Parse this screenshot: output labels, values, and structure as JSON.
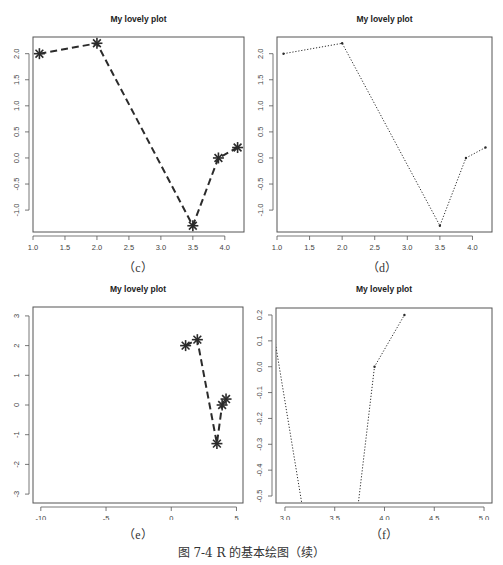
{
  "figure": {
    "caption": "图 7-4   R 的基本绘图（续）"
  },
  "chart_data": [
    {
      "id": "c",
      "panel_label": "（c）",
      "type": "line",
      "title": "My lovely plot",
      "x": [
        1.1,
        2.0,
        3.5,
        3.9,
        4.2
      ],
      "y": [
        2.0,
        2.2,
        -1.3,
        0.0,
        0.2
      ],
      "line_style": "dashed",
      "line_width": 2,
      "marker": "asterisk",
      "marker_size": "large",
      "xlim": [
        1.0,
        4.3
      ],
      "ylim": [
        -1.42,
        2.32
      ],
      "xticks": [
        1.0,
        1.5,
        2.0,
        2.5,
        3.0,
        3.5,
        4.0
      ],
      "xtick_labels": [
        "1.0",
        "1.5",
        "2.0",
        "2.5",
        "3.0",
        "3.5",
        "4.0"
      ],
      "yticks": [
        -1.0,
        -0.5,
        0.0,
        0.5,
        1.0,
        1.5,
        2.0
      ],
      "ytick_labels": [
        "-1.0",
        "-0.5",
        "0.0",
        "0.5",
        "1.0",
        "1.5",
        "2.0"
      ],
      "xlabel": "",
      "ylabel": "",
      "grid": false,
      "legend": null
    },
    {
      "id": "d",
      "panel_label": "（d）",
      "type": "line",
      "title": "My lovely plot",
      "x": [
        1.1,
        2.0,
        3.5,
        3.9,
        4.2
      ],
      "y": [
        2.0,
        2.2,
        -1.3,
        0.0,
        0.2
      ],
      "line_style": "dotted",
      "line_width": 1,
      "marker": "point",
      "marker_size": "small",
      "xlim": [
        1.0,
        4.3
      ],
      "ylim": [
        -1.42,
        2.32
      ],
      "xticks": [
        1.0,
        1.5,
        2.0,
        2.5,
        3.0,
        3.5,
        4.0
      ],
      "xtick_labels": [
        "1.0",
        "1.5",
        "2.0",
        "2.5",
        "3.0",
        "3.5",
        "4.0"
      ],
      "yticks": [
        -1.0,
        -0.5,
        0.0,
        0.5,
        1.0,
        1.5,
        2.0
      ],
      "ytick_labels": [
        "-1.0",
        "-0.5",
        "0.0",
        "0.5",
        "1.0",
        "1.5",
        "2.0"
      ],
      "xlabel": "",
      "ylabel": "",
      "grid": false,
      "legend": null
    },
    {
      "id": "e",
      "panel_label": "（e）",
      "type": "line",
      "title": "My lovely plot",
      "x": [
        1.1,
        2.0,
        3.5,
        3.9,
        4.2
      ],
      "y": [
        2.0,
        2.2,
        -1.3,
        0.0,
        0.2
      ],
      "line_style": "dashed",
      "line_width": 2,
      "marker": "asterisk",
      "marker_size": "large",
      "xlim": [
        -10.6,
        5.5
      ],
      "ylim": [
        -3.3,
        3.3
      ],
      "xticks": [
        -10,
        -5,
        0,
        5
      ],
      "xtick_labels": [
        "-10",
        "-5",
        "0",
        "5"
      ],
      "yticks": [
        -3,
        -2,
        -1,
        0,
        1,
        2,
        3
      ],
      "ytick_labels": [
        "-3",
        "-2",
        "-1",
        "0",
        "1",
        "2",
        "3"
      ],
      "xlabel": "",
      "ylabel": "",
      "grid": false,
      "legend": null
    },
    {
      "id": "f",
      "panel_label": "（f）",
      "type": "line",
      "title": "My lovely plot",
      "x": [
        1.1,
        2.0,
        3.5,
        3.9,
        4.2
      ],
      "y": [
        2.0,
        2.2,
        -1.3,
        0.0,
        0.2
      ],
      "line_style": "dotted",
      "line_width": 1,
      "marker": "point",
      "marker_size": "small",
      "xlim": [
        2.91,
        5.08
      ],
      "ylim": [
        -0.527,
        0.227
      ],
      "xticks": [
        3.0,
        3.5,
        4.0,
        4.5,
        5.0
      ],
      "xtick_labels": [
        "3.0",
        "3.5",
        "4.0",
        "4.5",
        "5.0"
      ],
      "yticks": [
        -0.5,
        -0.4,
        -0.3,
        -0.2,
        -0.1,
        0.0,
        0.1,
        0.2
      ],
      "ytick_labels": [
        "-0.5",
        "-0.4",
        "-0.3",
        "-0.2",
        "-0.1",
        "0.0",
        "0.1",
        "0.2"
      ],
      "xlabel": "",
      "ylabel": "",
      "grid": false,
      "legend": null
    }
  ],
  "style": {
    "line_color": "#2b2b2b",
    "frame_color": "#555555",
    "tick_label_color": "#444444",
    "title_color": "#222222"
  }
}
